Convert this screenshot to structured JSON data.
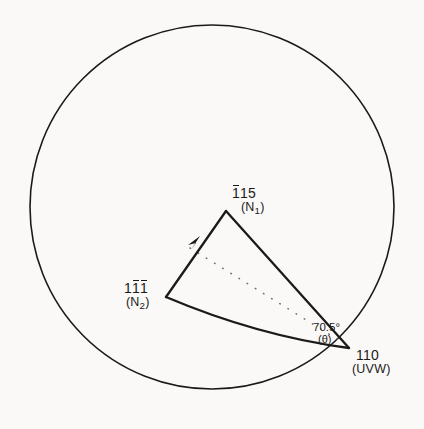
{
  "figure": {
    "type": "crystallographic-stereographic-projection",
    "background_color": "#faf9f7",
    "line_color": "#1a1a1a"
  },
  "circle": {
    "name": "primitive-circle",
    "center_x": 212,
    "center_y": 207,
    "radius": 182
  },
  "poles": {
    "n1": {
      "indices": "115",
      "overbar_digits": [
        0
      ],
      "display_digits": [
        "1",
        "1",
        "5"
      ],
      "normal_label": "(N",
      "normal_subscript": "1",
      "normal_close": ")",
      "x": 226,
      "y": 212
    },
    "n2": {
      "indices": "111",
      "overbar_digits": [
        1,
        2
      ],
      "display_digits": [
        "1",
        "1",
        "1"
      ],
      "normal_label": "(N",
      "normal_subscript": "2",
      "normal_close": ")",
      "x": 166,
      "y": 297
    },
    "uvw": {
      "indices": "110",
      "overbar_digits": [],
      "display_digits": [
        "1",
        "1",
        "0"
      ],
      "direction_label": "(UVW)",
      "x": 348,
      "y": 347
    }
  },
  "angle": {
    "name": "interplanar-angle",
    "value": "70.5",
    "degree_symbol": "°",
    "symbol_open": "(",
    "symbol": "θ",
    "symbol_close": ")",
    "x": 313,
    "y": 322
  },
  "edges": {
    "n2_to_n1": {
      "name": "great-circle-n2-n1",
      "has_arrow": true,
      "arrow_x": 198,
      "arrow_y": 241
    },
    "n1_to_uvw": {
      "name": "great-circle-n1-uvw",
      "has_arrow": false
    },
    "n2_to_uvw_arc": {
      "name": "great-circle-arc-n2-uvw",
      "has_arrow": false
    },
    "dotted": {
      "name": "dotted-reference-line",
      "style": "dotted",
      "from_x": 190,
      "from_y": 248,
      "to_x": 345,
      "to_y": 344
    }
  }
}
